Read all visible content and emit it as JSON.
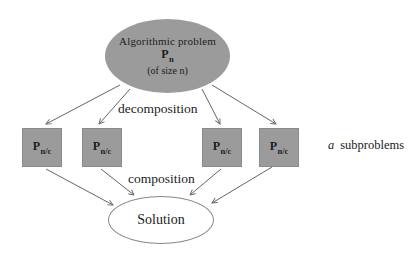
{
  "colors": {
    "node_fill": "#9b9b9b",
    "node_border": "#8a8a8a",
    "arrow": "#666666",
    "text": "#1c1c1c",
    "background": "#ffffff"
  },
  "diagram": {
    "problem": {
      "title": "Algorithmic problem",
      "symbol": {
        "main": "P",
        "sub": "n"
      },
      "size_note": "(of size n)"
    },
    "decomposition_label": "decomposition",
    "subproblems": [
      {
        "main": "P",
        "sub": "n/c"
      },
      {
        "main": "P",
        "sub": "n/c"
      },
      {
        "main": "P",
        "sub": "n/c"
      },
      {
        "main": "P",
        "sub": "n/c"
      }
    ],
    "subproblem_count_note": {
      "count_symbol": "a",
      "text": "subproblems"
    },
    "composition_label": "composition",
    "solution_label": "Solution"
  }
}
